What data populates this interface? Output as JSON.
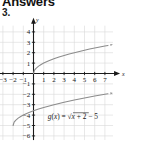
{
  "page": {
    "heading": "Answers",
    "item_number": "3."
  },
  "chart_data": {
    "type": "line",
    "title": "",
    "xlabel": "x",
    "ylabel": "y",
    "xlim": [
      -3.6,
      7.8
    ],
    "ylim": [
      -6.4,
      4.6
    ],
    "grid": true,
    "legend": "none",
    "x_ticks": [
      -3,
      -2,
      -1,
      1,
      2,
      3,
      4,
      5,
      6,
      7
    ],
    "x_tick_labels": [
      "-3",
      "-2",
      "-1",
      "1",
      "2",
      "3",
      "4",
      "5",
      "6",
      "7"
    ],
    "y_ticks": [
      4,
      3,
      2,
      1,
      -1,
      -2,
      -3,
      -4,
      -5,
      -6
    ],
    "y_tick_labels": [
      "4",
      "3",
      "2",
      "1",
      "-1",
      "-2",
      "-3",
      "-4",
      "-5",
      "-6"
    ],
    "annotations": [
      {
        "text": "g(x) = √x + 2 − 5",
        "x": 1.4,
        "y": -4.35
      }
    ],
    "series": [
      {
        "name": "f(x) = √x",
        "color": "#8c8c8c",
        "arrow_end": true,
        "x": [
          0,
          0.1,
          0.25,
          0.5,
          0.75,
          1,
          1.5,
          2,
          2.5,
          3,
          3.5,
          4,
          4.5,
          5,
          5.5,
          6,
          6.5,
          7,
          7.3
        ],
        "y": [
          0,
          0.32,
          0.5,
          0.71,
          0.87,
          1,
          1.22,
          1.41,
          1.58,
          1.73,
          1.87,
          2,
          2.12,
          2.24,
          2.35,
          2.45,
          2.55,
          2.65,
          2.7
        ]
      },
      {
        "name": "g(x) = √(x+2) − 5",
        "color": "#8c8c8c",
        "arrow_end": true,
        "x": [
          -2,
          -1.9,
          -1.75,
          -1.5,
          -1.25,
          -1,
          -0.5,
          0,
          0.5,
          1,
          2,
          3,
          4,
          5,
          6,
          7,
          7.3
        ],
        "y": [
          -5,
          -4.68,
          -4.5,
          -4.29,
          -4.13,
          -4,
          -3.78,
          -3.59,
          -3.42,
          -3.27,
          -3,
          -2.76,
          -2.55,
          -2.35,
          -2.17,
          -2,
          -1.95
        ]
      }
    ],
    "axis_labels": {
      "x_axis_letter": "x",
      "y_axis_letter": "y"
    },
    "colors": {
      "grid": "#d8d8d8",
      "axis": "#1a1a1a",
      "curve": "#8c8c8c",
      "text": "#1a1a1a"
    }
  }
}
